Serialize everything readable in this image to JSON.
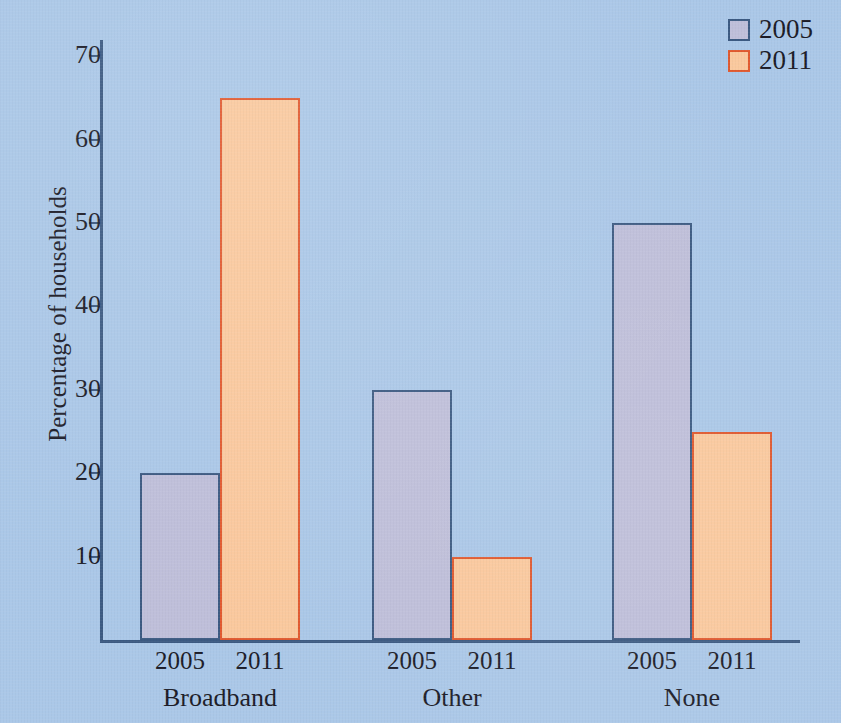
{
  "chart_data": {
    "type": "bar",
    "title": "",
    "subtitle": "",
    "xlabel": "",
    "ylabel": "Percentage of households",
    "categories": [
      "Broadband",
      "Other",
      "None"
    ],
    "series": [
      {
        "name": "2005",
        "values": [
          20,
          30,
          50
        ],
        "color": "#bfbfda",
        "border_color": "#3c5a82"
      },
      {
        "name": "2011",
        "values": [
          65,
          10,
          25
        ],
        "color": "#fac99e",
        "border_color": "#e0592f"
      }
    ],
    "ylim": [
      0,
      73
    ],
    "yticks": [
      10,
      20,
      30,
      40,
      50,
      60,
      70
    ],
    "ytick_labels": [
      "10",
      "20",
      "30",
      "40",
      "50",
      "60",
      "70"
    ],
    "grid": false,
    "legend_position": "top-right",
    "legend_entries": [
      "2005",
      "2011"
    ],
    "background_color": "#abc8e8",
    "axis_color": "#3c5a82",
    "text_color": "#1c1c28"
  },
  "legend": {
    "items": [
      {
        "label": "2005"
      },
      {
        "label": "2011"
      }
    ]
  },
  "axis": {
    "y_title": "Percentage of households",
    "y_ticks": [
      "70",
      "60",
      "50",
      "40",
      "30",
      "20",
      "10"
    ]
  },
  "groups": [
    {
      "label": "Broadband",
      "bars": [
        {
          "series": "2005",
          "value": 20
        },
        {
          "series": "2011",
          "value": 65
        }
      ]
    },
    {
      "label": "Other",
      "bars": [
        {
          "series": "2005",
          "value": 30
        },
        {
          "series": "2011",
          "value": 10
        }
      ]
    },
    {
      "label": "None",
      "bars": [
        {
          "series": "2005",
          "value": 50
        },
        {
          "series": "2011",
          "value": 25
        }
      ]
    }
  ]
}
